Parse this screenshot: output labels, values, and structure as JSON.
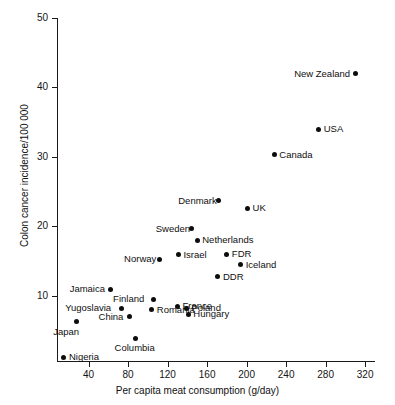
{
  "chart_data": {
    "type": "scatter",
    "title": "",
    "xlabel": "Per capita meat consumption (g/day)",
    "ylabel": "Colon cancer incidence/100 000",
    "xlim": [
      8,
      330
    ],
    "ylim": [
      0.5,
      50
    ],
    "xticks": [
      40,
      80,
      120,
      160,
      200,
      240,
      280,
      320
    ],
    "yticks": [
      10,
      20,
      30,
      40,
      50
    ],
    "grid": false,
    "legend": "none",
    "marker_color": "#0d0d0d",
    "points": [
      {
        "label": "New Zealand",
        "x": 310,
        "y": 42.0,
        "label_side": "left"
      },
      {
        "label": "USA",
        "x": 273,
        "y": 34.0,
        "label_side": "right"
      },
      {
        "label": "Canada",
        "x": 228,
        "y": 30.3,
        "label_side": "right"
      },
      {
        "label": "Denmark",
        "x": 172,
        "y": 23.7,
        "label_side": "left"
      },
      {
        "label": "UK",
        "x": 201,
        "y": 22.6,
        "label_side": "right"
      },
      {
        "label": "Sweden",
        "x": 144,
        "y": 19.7,
        "label_side": "left"
      },
      {
        "label": "Netherlands",
        "x": 150,
        "y": 18.0,
        "label_side": "right"
      },
      {
        "label": "FDR",
        "x": 180,
        "y": 16.0,
        "label_side": "right"
      },
      {
        "label": "Israel",
        "x": 131,
        "y": 15.9,
        "label_side": "right"
      },
      {
        "label": "Norway",
        "x": 112,
        "y": 15.3,
        "label_side": "left"
      },
      {
        "label": "Iceland",
        "x": 194,
        "y": 14.5,
        "label_side": "right"
      },
      {
        "label": "DDR",
        "x": 171,
        "y": 12.8,
        "label_side": "right"
      },
      {
        "label": "Jamaica",
        "x": 62,
        "y": 11.0,
        "label_side": "left"
      },
      {
        "label": "Finland",
        "x": 106,
        "y": 9.5,
        "label_side": "left"
      },
      {
        "label": "France",
        "x": 130,
        "y": 8.5,
        "label_side": "right"
      },
      {
        "label": "Poland",
        "x": 139,
        "y": 8.2,
        "label_side": "right"
      },
      {
        "label": "Yugoslavia",
        "x": 73,
        "y": 8.2,
        "label_side": "left"
      },
      {
        "label": "Romania",
        "x": 104,
        "y": 8.0,
        "label_side": "right"
      },
      {
        "label": "Hungary",
        "x": 141,
        "y": 7.4,
        "label_side": "right"
      },
      {
        "label": "China",
        "x": 81,
        "y": 7.0,
        "label_side": "left"
      },
      {
        "label": "Japan",
        "x": 28,
        "y": 6.3,
        "label_side": "below-left"
      },
      {
        "label": "Columbia",
        "x": 87,
        "y": 3.9,
        "label_side": "below"
      },
      {
        "label": "Nigeria",
        "x": 15,
        "y": 1.2,
        "label_side": "right"
      }
    ]
  }
}
